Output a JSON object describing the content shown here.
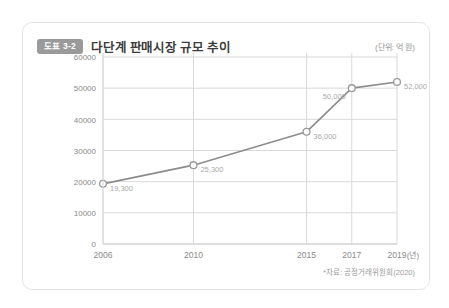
{
  "card": {
    "badge": "도표 3-2",
    "title": "다단계 판매시장 규모 추이",
    "unit_note": "(단위: 억 원)",
    "source_note": "*자료: 공정거래위원회(2020)"
  },
  "colors": {
    "badge_bg": "#9a9a9a",
    "badge_text": "#ffffff",
    "title_text": "#3c3c3c",
    "line": "#8c8c8c",
    "marker_stroke": "#9a9a9a",
    "marker_fill": "#ffffff",
    "grid": "#d9d9d9",
    "axis": "#bdbdbd",
    "tick_text": "#8a8a8a",
    "label_text": "#a8a8a8",
    "card_border": "#e3e3e3",
    "background": "#ffffff"
  },
  "chart_data": {
    "type": "line",
    "title": "다단계 판매시장 규모 추이",
    "xlabel": "(년)",
    "ylabel": "",
    "unit": "억 원",
    "x": [
      2006,
      2010,
      2015,
      2017,
      2019
    ],
    "categories": [
      "2006",
      "2010",
      "2015",
      "2017",
      "2019"
    ],
    "values": [
      19300,
      25300,
      36000,
      50000,
      52000
    ],
    "point_labels": [
      "19,300",
      "25,300",
      "36,000",
      "50,000",
      "52,000"
    ],
    "xlim": [
      2006,
      2019
    ],
    "ylim": [
      0,
      60000
    ],
    "ytick_values": [
      0,
      10000,
      20000,
      30000,
      40000,
      50000,
      60000
    ],
    "ytick_labels": [
      "0",
      "10000",
      "20000",
      "30000",
      "40000",
      "50000",
      "60000"
    ],
    "xtick_labels": [
      "2006",
      "2010",
      "2015",
      "2017",
      "2019"
    ],
    "grid": true,
    "grid_axes": "both",
    "legend": false,
    "legend_position": "none",
    "markers": "open-circle",
    "source": "*자료: 공정거래위원회(2020)"
  }
}
